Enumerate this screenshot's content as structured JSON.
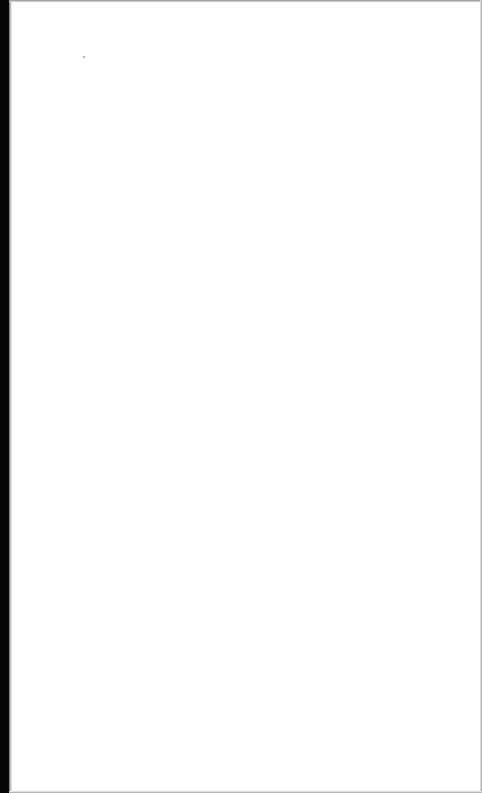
{
  "document": {
    "type": "scanned-page",
    "content": "",
    "colors": {
      "paper": "#ffffff",
      "binding_edge": "#050505"
    }
  }
}
